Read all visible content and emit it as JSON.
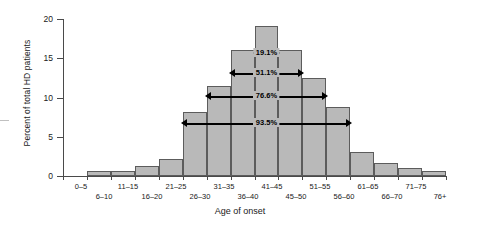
{
  "chart_data": {
    "type": "bar",
    "title": "",
    "subtitle": "",
    "xlabel": "Age of onset",
    "ylabel": "Percent of total HD patients",
    "categories": [
      "0–5",
      "6–10",
      "11–15",
      "16–20",
      "21–25",
      "26–30",
      "31–35",
      "36–40",
      "41–45",
      "45–50",
      "51–55",
      "56–60",
      "61–65",
      "66–70",
      "71–75",
      "76+"
    ],
    "values": [
      0,
      0.7,
      0.7,
      1.3,
      2.2,
      8.1,
      11.5,
      16.0,
      19.1,
      16.0,
      12.5,
      8.8,
      3.0,
      1.6,
      1.0,
      0.7
    ],
    "ylim": [
      0,
      20
    ],
    "yticks": [
      0,
      5,
      10,
      15,
      20
    ],
    "ytick_labels": [
      "0",
      "5",
      "10",
      "15",
      "20"
    ],
    "grid": false,
    "legend": "none",
    "bar_fill": "#b9b9b9",
    "bar_edge": "#5c5c5c",
    "annotations": [
      {
        "label": "19.1%",
        "span_start": "41–45",
        "span_end": "41–45",
        "level": 1
      },
      {
        "label": "51.1%",
        "span_start": "36–40",
        "span_end": "45–50",
        "level": 2
      },
      {
        "label": "76.6%",
        "span_start": "31–35",
        "span_end": "51–55",
        "level": 3
      },
      {
        "label": "93.5%",
        "span_start": "26–30",
        "span_end": "56–60",
        "level": 4
      }
    ]
  },
  "axes": {
    "y_label": "Percent of total HD patients",
    "x_label": "Age of onset",
    "y_ticks": [
      {
        "value": "20"
      },
      {
        "value": "15"
      },
      {
        "value": "10"
      },
      {
        "value": "5"
      },
      {
        "value": "0"
      }
    ]
  },
  "x_tick_labels": [
    {
      "text": "0–5"
    },
    {
      "text": "6–10"
    },
    {
      "text": "11–15"
    },
    {
      "text": "16–20"
    },
    {
      "text": "21–25"
    },
    {
      "text": "26–30"
    },
    {
      "text": "31–35"
    },
    {
      "text": "36–40"
    },
    {
      "text": "41–45"
    },
    {
      "text": "45–50"
    },
    {
      "text": "51–55"
    },
    {
      "text": "56–60"
    },
    {
      "text": "61–65"
    },
    {
      "text": "66–70"
    },
    {
      "text": "71–75"
    },
    {
      "text": "76+"
    }
  ],
  "annotation_labels": [
    {
      "text": "19.1%"
    },
    {
      "text": "51.1%"
    },
    {
      "text": "76.6%"
    },
    {
      "text": "93.5%"
    }
  ]
}
